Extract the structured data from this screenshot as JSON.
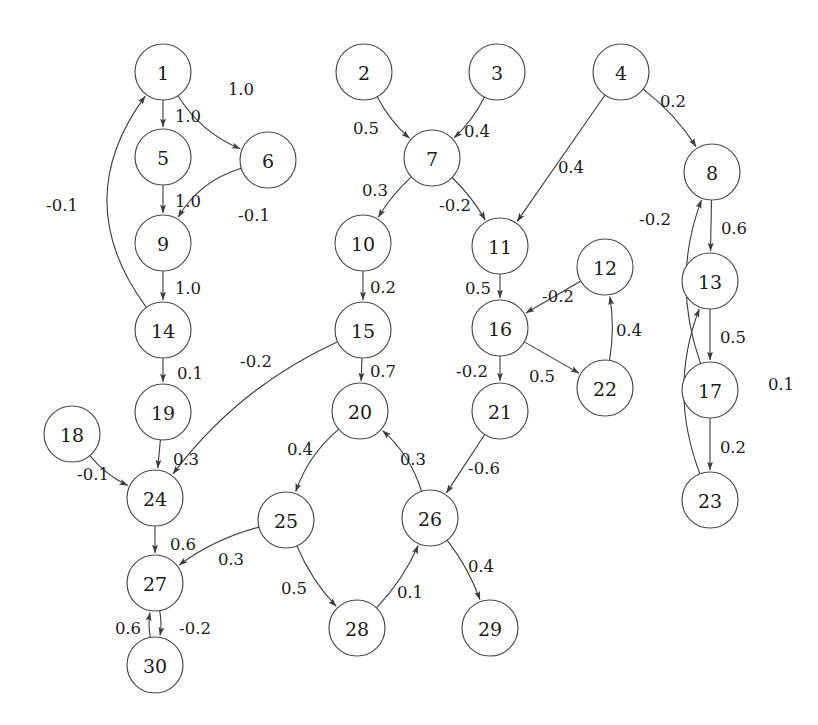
{
  "diagram": {
    "type": "directed-weighted-graph",
    "node_count": 30,
    "edge_count": 32,
    "background_color": "#ffffff",
    "node_fill_color": "#ffffff",
    "node_stroke_color": "#4a4a4a",
    "edge_color": "#3c3c3c",
    "label_color": "#1a1a1a",
    "node_radius": 28
  },
  "nodes": [
    {
      "id": "1",
      "label": "1",
      "x": 163,
      "y": 72
    },
    {
      "id": "2",
      "label": "2",
      "x": 364,
      "y": 72
    },
    {
      "id": "3",
      "label": "3",
      "x": 497,
      "y": 72
    },
    {
      "id": "4",
      "label": "4",
      "x": 621,
      "y": 72
    },
    {
      "id": "5",
      "label": "5",
      "x": 163,
      "y": 157
    },
    {
      "id": "6",
      "label": "6",
      "x": 268,
      "y": 160
    },
    {
      "id": "7",
      "label": "7",
      "x": 432,
      "y": 158
    },
    {
      "id": "8",
      "label": "8",
      "x": 712,
      "y": 172
    },
    {
      "id": "9",
      "label": "9",
      "x": 163,
      "y": 243
    },
    {
      "id": "10",
      "label": "10",
      "x": 363,
      "y": 243
    },
    {
      "id": "11",
      "label": "11",
      "x": 500,
      "y": 246
    },
    {
      "id": "12",
      "label": "12",
      "x": 605,
      "y": 267
    },
    {
      "id": "13",
      "label": "13",
      "x": 710,
      "y": 281
    },
    {
      "id": "14",
      "label": "14",
      "x": 163,
      "y": 330
    },
    {
      "id": "15",
      "label": "15",
      "x": 363,
      "y": 330
    },
    {
      "id": "16",
      "label": "16",
      "x": 500,
      "y": 328
    },
    {
      "id": "17",
      "label": "17",
      "x": 710,
      "y": 390
    },
    {
      "id": "18",
      "label": "18",
      "x": 72,
      "y": 434
    },
    {
      "id": "19",
      "label": "19",
      "x": 163,
      "y": 412
    },
    {
      "id": "20",
      "label": "20",
      "x": 360,
      "y": 411
    },
    {
      "id": "21",
      "label": "21",
      "x": 500,
      "y": 411
    },
    {
      "id": "22",
      "label": "22",
      "x": 605,
      "y": 388
    },
    {
      "id": "23",
      "label": "23",
      "x": 710,
      "y": 500
    },
    {
      "id": "24",
      "label": "24",
      "x": 155,
      "y": 498
    },
    {
      "id": "25",
      "label": "25",
      "x": 286,
      "y": 520
    },
    {
      "id": "26",
      "label": "26",
      "x": 430,
      "y": 518
    },
    {
      "id": "27",
      "label": "27",
      "x": 155,
      "y": 583
    },
    {
      "id": "28",
      "label": "28",
      "x": 357,
      "y": 628
    },
    {
      "id": "29",
      "label": "29",
      "x": 490,
      "y": 628
    },
    {
      "id": "30",
      "label": "30",
      "x": 155,
      "y": 665
    }
  ],
  "edges": [
    {
      "from": "1",
      "to": "5",
      "weight": "1.0",
      "lx": 188,
      "ly": 116,
      "curve": 0
    },
    {
      "from": "1",
      "to": "6",
      "weight": "1.0",
      "lx": 241,
      "ly": 89,
      "curve": 22
    },
    {
      "from": "5",
      "to": "9",
      "weight": "1.0",
      "lx": 188,
      "ly": 201,
      "curve": 0
    },
    {
      "from": "6",
      "to": "9",
      "weight": "-0.1",
      "lx": 254,
      "ly": 215,
      "curve": 26
    },
    {
      "from": "9",
      "to": "14",
      "weight": "1.0",
      "lx": 188,
      "ly": 288,
      "curve": 0
    },
    {
      "from": "14",
      "to": "1",
      "weight": "-0.1",
      "lx": 62,
      "ly": 205,
      "curve": -95
    },
    {
      "from": "14",
      "to": "19",
      "weight": "0.1",
      "lx": 190,
      "ly": 373,
      "curve": 0
    },
    {
      "from": "19",
      "to": "24",
      "weight": "0.3",
      "lx": 186,
      "ly": 459,
      "curve": 0
    },
    {
      "from": "18",
      "to": "24",
      "weight": "-0.1",
      "lx": 93,
      "ly": 474,
      "curve": 12
    },
    {
      "from": "15",
      "to": "24",
      "weight": "-0.2",
      "lx": 256,
      "ly": 361,
      "curve": 34
    },
    {
      "from": "24",
      "to": "27",
      "weight": "0.6",
      "lx": 183,
      "ly": 544,
      "curve": 0
    },
    {
      "from": "25",
      "to": "27",
      "weight": "0.3",
      "lx": 231,
      "ly": 559,
      "curve": 14
    },
    {
      "from": "27",
      "to": "30",
      "weight": "0.6",
      "lx": 128,
      "ly": 628,
      "curve": -7
    },
    {
      "from": "30",
      "to": "27",
      "weight": "-0.2",
      "lx": 195,
      "ly": 628,
      "curve": -7
    },
    {
      "from": "2",
      "to": "7",
      "weight": "0.5",
      "lx": 366,
      "ly": 128,
      "curve": 10
    },
    {
      "from": "3",
      "to": "7",
      "weight": "0.4",
      "lx": 477,
      "ly": 131,
      "curve": -10
    },
    {
      "from": "7",
      "to": "10",
      "weight": "0.3",
      "lx": 375,
      "ly": 190,
      "curve": 8
    },
    {
      "from": "7",
      "to": "11",
      "weight": "-0.2",
      "lx": 455,
      "ly": 205,
      "curve": -8
    },
    {
      "from": "4",
      "to": "11",
      "weight": "0.4",
      "lx": 571,
      "ly": 167,
      "curve": 0
    },
    {
      "from": "4",
      "to": "8",
      "weight": "0.2",
      "lx": 673,
      "ly": 101,
      "curve": -12
    },
    {
      "from": "10",
      "to": "15",
      "weight": "0.2",
      "lx": 383,
      "ly": 287,
      "curve": 0
    },
    {
      "from": "15",
      "to": "20",
      "weight": "0.7",
      "lx": 383,
      "ly": 371,
      "curve": 0
    },
    {
      "from": "11",
      "to": "16",
      "weight": "0.5",
      "lx": 478,
      "ly": 288,
      "curve": 0
    },
    {
      "from": "12",
      "to": "16",
      "weight": "-0.2",
      "lx": 558,
      "ly": 296,
      "curve": 0
    },
    {
      "from": "16",
      "to": "21",
      "weight": "-0.2",
      "lx": 472,
      "ly": 371,
      "curve": 0
    },
    {
      "from": "16",
      "to": "22",
      "weight": "0.5",
      "lx": 542,
      "ly": 376,
      "curve": 0
    },
    {
      "from": "22",
      "to": "12",
      "weight": "0.4",
      "lx": 629,
      "ly": 330,
      "curve": 10
    },
    {
      "from": "20",
      "to": "25",
      "weight": "0.4",
      "lx": 300,
      "ly": 449,
      "curve": 18
    },
    {
      "from": "26",
      "to": "20",
      "weight": "0.3",
      "lx": 413,
      "ly": 459,
      "curve": 18
    },
    {
      "from": "21",
      "to": "26",
      "weight": "-0.6",
      "lx": 484,
      "ly": 468,
      "curve": 0
    },
    {
      "from": "25",
      "to": "28",
      "weight": "0.5",
      "lx": 294,
      "ly": 588,
      "curve": 12
    },
    {
      "from": "28",
      "to": "26",
      "weight": "0.1",
      "lx": 410,
      "ly": 592,
      "curve": 12
    },
    {
      "from": "26",
      "to": "29",
      "weight": "0.4",
      "lx": 481,
      "ly": 566,
      "curve": -10
    },
    {
      "from": "8",
      "to": "13",
      "weight": "0.6",
      "lx": 734,
      "ly": 228,
      "curve": 0
    },
    {
      "from": "13",
      "to": "17",
      "weight": "0.5",
      "lx": 733,
      "ly": 337,
      "curve": 0
    },
    {
      "from": "17",
      "to": "8",
      "weight": "-0.2",
      "lx": 655,
      "ly": 219,
      "curve": -40
    },
    {
      "from": "17",
      "to": "23",
      "weight": "0.2",
      "lx": 733,
      "ly": 447,
      "curve": 0
    },
    {
      "from": "23",
      "to": "13",
      "weight": "0.1",
      "lx": 781,
      "ly": 384,
      "curve": -42
    }
  ]
}
